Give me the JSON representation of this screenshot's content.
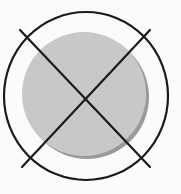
{
  "diagram": {
    "type": "icon",
    "colors": {
      "background": "#fbfbfb",
      "stroke": "#1a1a1a",
      "disc_fill": "#c8c8c8",
      "disc_shadow": "#9a9a9a"
    },
    "outer_ring": {
      "cx": 86,
      "cy": 96,
      "rx": 82,
      "ry": 84,
      "stroke_width": 2.2
    },
    "disc": {
      "cx": 84,
      "cy": 94,
      "r": 62,
      "shadow_dx": 3,
      "shadow_dy": 3
    },
    "cross_lines": [
      {
        "x1": 20,
        "y1": 30,
        "x2": 150,
        "y2": 167
      },
      {
        "x1": 150,
        "y1": 30,
        "x2": 22,
        "y2": 167
      }
    ]
  }
}
